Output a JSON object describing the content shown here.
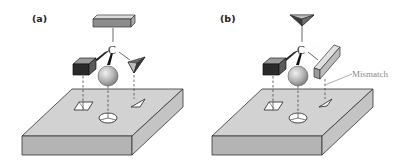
{
  "figure": {
    "panels": [
      {
        "id": "a",
        "label": "(a)",
        "center_atom": "C",
        "substituents": [
          "flat-bar (top)",
          "dark-block (left)",
          "sphere (front)",
          "pyramid (right)"
        ],
        "binding_site": [
          "square-hole",
          "circle-hole",
          "triangle-hole"
        ],
        "match": "all substituents fit binding site"
      },
      {
        "id": "b",
        "label": "(b)",
        "center_atom": "C",
        "substituents": [
          "pyramid (top)",
          "dark-block (left)",
          "sphere (front)",
          "flat-bar (right)"
        ],
        "binding_site": [
          "square-hole",
          "circle-hole",
          "triangle-hole"
        ],
        "annotation": "Mismatch"
      }
    ],
    "colors": {
      "slab_top": "#d2d2d2",
      "slab_front": "#b4b4b4",
      "slab_side": "#c4c4c4",
      "outline": "#333333",
      "dark_block": "#2a2a2a",
      "annotation": "#8a8a8a"
    }
  }
}
